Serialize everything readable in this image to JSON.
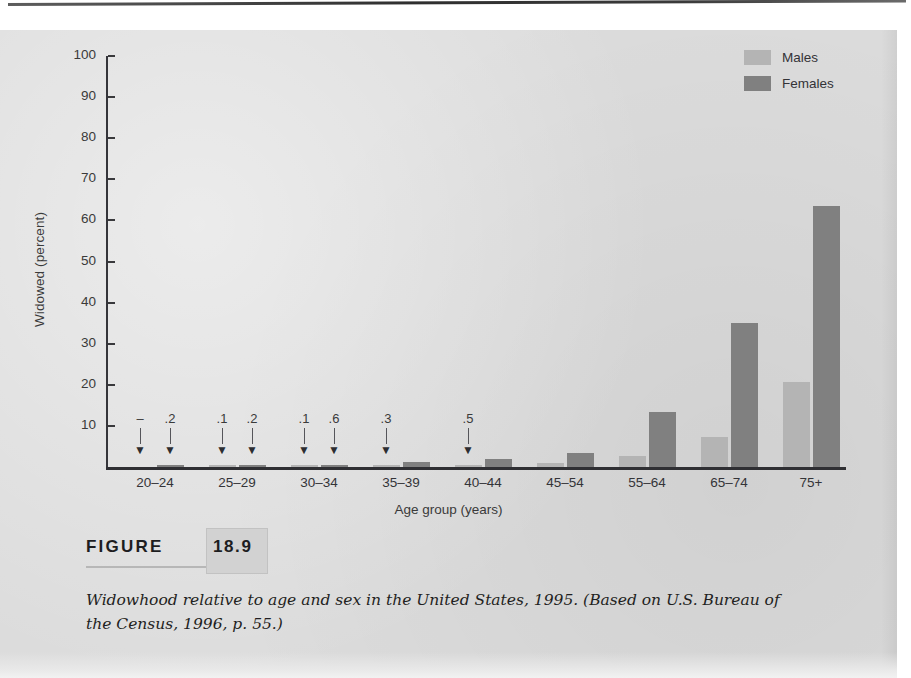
{
  "chart_data": {
    "type": "bar",
    "title": "",
    "xlabel": "Age group (years)",
    "ylabel": "Widowed (percent)",
    "ylim": [
      0,
      100
    ],
    "yticks": [
      10,
      20,
      30,
      40,
      50,
      60,
      70,
      80,
      90,
      100
    ],
    "grid": false,
    "legend_position": "top-right",
    "categories": [
      "20–24",
      "25–29",
      "30–34",
      "35–39",
      "40–44",
      "45–54",
      "55–64",
      "65–74",
      "75+"
    ],
    "series": [
      {
        "name": "Males",
        "color": "#b4b4b4",
        "values": [
          0,
          0.1,
          0.1,
          0.3,
          0.5,
          0.9,
          2.7,
          7.3,
          20.8
        ],
        "point_labels": [
          "–",
          ".1",
          ".1",
          ".3",
          ".5",
          "",
          "",
          "",
          ""
        ]
      },
      {
        "name": "Females",
        "color": "#808080",
        "values": [
          0.2,
          0.2,
          0.6,
          1.1,
          2.0,
          3.5,
          13.5,
          35.0,
          63.5
        ],
        "point_labels": [
          ".2",
          ".2",
          ".6",
          "",
          "",
          "",
          "",
          "",
          ""
        ]
      }
    ]
  },
  "legend": {
    "items": [
      {
        "label": "Males",
        "color": "#b4b4b4"
      },
      {
        "label": "Females",
        "color": "#808080"
      }
    ]
  },
  "figure": {
    "word": "FIGURE",
    "number": "18.9",
    "caption": "Widowhood relative to age and sex in the United States, 1995. (Based on U.S. Bureau of the Census, 1996, p. 55.)"
  }
}
